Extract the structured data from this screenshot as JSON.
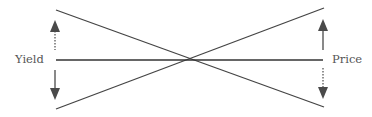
{
  "diagram": {
    "labels": {
      "left": "Yield",
      "right": "Price"
    },
    "colors": {
      "line": "#444444",
      "arrow": "#4a4a4a",
      "text": "#555555",
      "background": "#ffffff"
    },
    "arrows": [
      {
        "side": "left",
        "direction": "up",
        "shaft": "dotted"
      },
      {
        "side": "left",
        "direction": "down",
        "shaft": "solid"
      },
      {
        "side": "right",
        "direction": "up",
        "shaft": "solid"
      },
      {
        "side": "right",
        "direction": "down",
        "shaft": "dotted"
      }
    ]
  }
}
